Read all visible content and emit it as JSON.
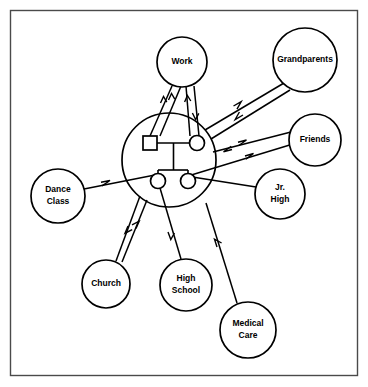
{
  "diagram": {
    "type": "ecomap",
    "border_color": "#4a4a4a",
    "line_color": "#000000",
    "background": "#ffffff",
    "family_unit": {
      "name": "household-circle",
      "center": [
        169,
        160
      ],
      "radius": 47,
      "members": [
        {
          "id": "father",
          "shape": "square",
          "label": "",
          "cx": 150,
          "cy": 143,
          "size": 14
        },
        {
          "id": "mother",
          "shape": "circle",
          "label": "",
          "cx": 197,
          "cy": 143,
          "r": 7.5
        },
        {
          "id": "child-1",
          "shape": "circle",
          "label": "",
          "cx": 158,
          "cy": 181,
          "r": 7.5
        },
        {
          "id": "child-2",
          "shape": "circle",
          "label": "",
          "cx": 188,
          "cy": 181,
          "r": 7.5
        }
      ]
    },
    "nodes": [
      {
        "id": "work",
        "label": "Work",
        "cx": 182,
        "cy": 62,
        "r": 25,
        "lines": [
          "Work"
        ]
      },
      {
        "id": "grandparents",
        "label": "Grandparents",
        "cx": 305,
        "cy": 60,
        "r": 32,
        "lines": [
          "Grandparents"
        ]
      },
      {
        "id": "friends",
        "label": "Friends",
        "cx": 315,
        "cy": 140,
        "r": 26,
        "lines": [
          "Friends"
        ]
      },
      {
        "id": "jr-high",
        "label": "Jr. High",
        "cx": 280,
        "cy": 194,
        "r": 25,
        "lines": [
          "Jr.",
          "High"
        ]
      },
      {
        "id": "dance-class",
        "label": "Dance Class",
        "cx": 58,
        "cy": 196,
        "r": 27,
        "lines": [
          "Dance",
          "Class"
        ]
      },
      {
        "id": "church",
        "label": "Church",
        "cx": 106,
        "cy": 284,
        "r": 24,
        "lines": [
          "Church"
        ]
      },
      {
        "id": "high-school",
        "label": "High School",
        "cx": 186,
        "cy": 285,
        "r": 26,
        "lines": [
          "High",
          "School"
        ]
      },
      {
        "id": "medical-care",
        "label": "Medical Care",
        "cx": 248,
        "cy": 330,
        "r": 28,
        "lines": [
          "Medical",
          "Care"
        ]
      }
    ],
    "connections": [
      {
        "id": "father-to-work",
        "from": "father",
        "to": "work",
        "flow": "outward-to-node",
        "arrows": 2,
        "direction": "toward-work"
      },
      {
        "id": "mother-to-work",
        "from": "mother",
        "to": "work",
        "flow": "bidirectional",
        "arrows": 2,
        "direction": "both"
      },
      {
        "id": "family-to-grandparents",
        "from": "household",
        "to": "grandparents",
        "flow": "bidirectional",
        "arrows": 2,
        "direction": "both"
      },
      {
        "id": "family-to-friends-upper",
        "from": "household",
        "to": "friends",
        "flow": "bidirectional",
        "arrows": 2,
        "direction": "both"
      },
      {
        "id": "child-to-friends-lower",
        "from": "child-2",
        "to": "friends",
        "flow": "toward-node",
        "arrows": 1,
        "direction": "toward-friends"
      },
      {
        "id": "dance-class-to-child",
        "from": "dance-class",
        "to": "child-1",
        "flow": "toward-family",
        "arrows": 1,
        "direction": "toward-family"
      },
      {
        "id": "jr-high-to-family",
        "from": "jr-high",
        "to": "household",
        "flow": "plain",
        "arrows": 0,
        "direction": "none"
      },
      {
        "id": "family-to-church",
        "from": "household",
        "to": "church",
        "flow": "bidirectional",
        "arrows": 2,
        "direction": "both"
      },
      {
        "id": "child-to-high-school",
        "from": "child-1",
        "to": "high-school",
        "flow": "toward-node",
        "arrows": 1,
        "direction": "toward-high-school"
      },
      {
        "id": "medical-care-to-family",
        "from": "medical-care",
        "to": "household",
        "flow": "toward-family",
        "arrows": 1,
        "direction": "toward-family"
      }
    ]
  }
}
